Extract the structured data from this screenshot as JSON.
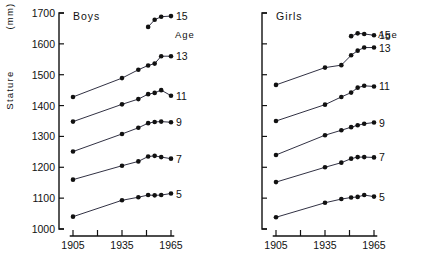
{
  "figure": {
    "y_axis": {
      "label_main": "Stature",
      "label_unit": "(mm)"
    },
    "panels": [
      {
        "key": "boys",
        "title": "Boys",
        "age_header": "Age"
      },
      {
        "key": "girls",
        "title": "Girls",
        "age_header": "Age"
      }
    ]
  },
  "chart_data": {
    "type": "line",
    "title": "",
    "xlabel": "",
    "ylabel": "Stature (mm)",
    "ylim": [
      1000,
      1700
    ],
    "xlim": [
      1900,
      1970
    ],
    "ytick_labels": [
      "1000",
      "1100",
      "1200",
      "1300",
      "1400",
      "1500",
      "1600",
      "1700"
    ],
    "yticks": [
      1000,
      1100,
      1200,
      1300,
      1400,
      1500,
      1600,
      1700
    ],
    "xtick_labels": [
      "1905",
      "",
      "1935",
      "",
      "1965"
    ],
    "xticks": [
      1905,
      1920,
      1935,
      1950,
      1965
    ],
    "grid": false,
    "legend": "right-of-line age annotations",
    "panels": [
      {
        "name": "Boys",
        "annotation": "Age",
        "series": [
          {
            "name": "15",
            "label": "15",
            "x": [
              1951,
              1955,
              1959,
              1965
            ],
            "y": [
              1655,
              1678,
              1688,
              1690
            ]
          },
          {
            "name": "13",
            "label": "13",
            "x": [
              1905,
              1935,
              1945,
              1951,
              1955,
              1959,
              1965
            ],
            "y": [
              1428,
              1489,
              1516,
              1530,
              1536,
              1560,
              1560
            ]
          },
          {
            "name": "11",
            "label": "11",
            "x": [
              1905,
              1935,
              1945,
              1951,
              1955,
              1959,
              1965
            ],
            "y": [
              1348,
              1404,
              1421,
              1437,
              1441,
              1450,
              1432
            ]
          },
          {
            "name": "9",
            "label": "9",
            "x": [
              1905,
              1935,
              1945,
              1951,
              1955,
              1959,
              1965
            ],
            "y": [
              1251,
              1308,
              1328,
              1343,
              1347,
              1348,
              1346
            ]
          },
          {
            "name": "7",
            "label": "7",
            "x": [
              1905,
              1935,
              1945,
              1951,
              1955,
              1959,
              1965
            ],
            "y": [
              1160,
              1205,
              1219,
              1235,
              1237,
              1233,
              1228
            ]
          },
          {
            "name": "5",
            "label": "5",
            "x": [
              1905,
              1935,
              1945,
              1951,
              1955,
              1959,
              1965
            ],
            "y": [
              1040,
              1093,
              1103,
              1110,
              1109,
              1110,
              1115
            ]
          }
        ]
      },
      {
        "name": "Girls",
        "annotation": "Age",
        "series": [
          {
            "name": "15",
            "label": "15",
            "x": [
              1951,
              1955,
              1959,
              1965
            ],
            "y": [
              1625,
              1634,
              1632,
              1628
            ]
          },
          {
            "name": "13",
            "label": "13",
            "x": [
              1905,
              1935,
              1945,
              1951,
              1955,
              1959,
              1965
            ],
            "y": [
              1467,
              1523,
              1531,
              1563,
              1578,
              1588,
              1588
            ]
          },
          {
            "name": "11",
            "label": "11",
            "x": [
              1905,
              1935,
              1945,
              1951,
              1955,
              1959,
              1965
            ],
            "y": [
              1350,
              1403,
              1428,
              1442,
              1458,
              1464,
              1462
            ]
          },
          {
            "name": "9",
            "label": "9",
            "x": [
              1905,
              1935,
              1945,
              1951,
              1955,
              1959,
              1965
            ],
            "y": [
              1240,
              1304,
              1320,
              1330,
              1336,
              1341,
              1345
            ]
          },
          {
            "name": "7",
            "label": "7",
            "x": [
              1905,
              1935,
              1945,
              1951,
              1955,
              1959,
              1965
            ],
            "y": [
              1152,
              1200,
              1215,
              1228,
              1233,
              1233,
              1232
            ]
          },
          {
            "name": "5",
            "label": "5",
            "x": [
              1905,
              1935,
              1945,
              1951,
              1955,
              1959,
              1965
            ],
            "y": [
              1038,
              1085,
              1097,
              1102,
              1104,
              1110,
              1105
            ]
          }
        ]
      }
    ]
  }
}
